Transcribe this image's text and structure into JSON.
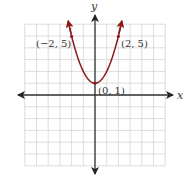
{
  "chart_data": {
    "type": "line",
    "title": "",
    "xlabel": "x",
    "ylabel": "y",
    "xlim": [
      -6,
      6
    ],
    "ylim": [
      -6,
      6
    ],
    "grid": true,
    "function": "y = x^2 + 1",
    "series": [
      {
        "name": "parabola",
        "color": "#8b1a1a",
        "x": [
          -2.2,
          -2,
          -1.5,
          -1,
          -0.5,
          0,
          0.5,
          1,
          1.5,
          2,
          2.2
        ],
        "y": [
          5.84,
          5,
          3.25,
          2,
          1.25,
          1,
          1.25,
          2,
          3.25,
          5,
          5.84
        ]
      }
    ],
    "annotations": [
      {
        "text": "(−2, 5)",
        "x": -2,
        "y": 5
      },
      {
        "text": "(0, 1)",
        "x": 0,
        "y": 1
      },
      {
        "text": "(2, 5)",
        "x": 2,
        "y": 5
      }
    ]
  },
  "labels": {
    "x_axis": "x",
    "y_axis": "y",
    "point_left": "(−2, 5)",
    "point_vertex": "(0, 1)",
    "point_right": "(2, 5)"
  },
  "colors": {
    "curve": "#8b1a1a",
    "grid": "#d4d4d4",
    "axis": "#333333"
  }
}
